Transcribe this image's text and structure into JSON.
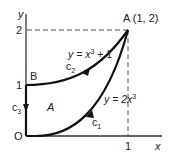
{
  "diagram": {
    "axes": {
      "x_label": "x",
      "y_label": "y",
      "origin_label": "O",
      "x_tick": "1",
      "y_ticks": [
        "1",
        "2"
      ]
    },
    "points": {
      "A": {
        "label": "A (1, 2)"
      },
      "B": {
        "label": "B"
      }
    },
    "curves": {
      "c1": {
        "label": "c",
        "sub": "1",
        "equation_lhs": "y = 2x",
        "equation_exp": "3",
        "equation_tail": ""
      },
      "c2": {
        "label": "c",
        "sub": "2",
        "equation_lhs": "y = x",
        "equation_exp": "3",
        "equation_tail": " + 1"
      },
      "c3": {
        "label": "c",
        "sub": "3"
      }
    },
    "region_label": "A",
    "colors": {
      "curve": "#111111",
      "axis": "#333333",
      "dashed": "#555555"
    }
  }
}
